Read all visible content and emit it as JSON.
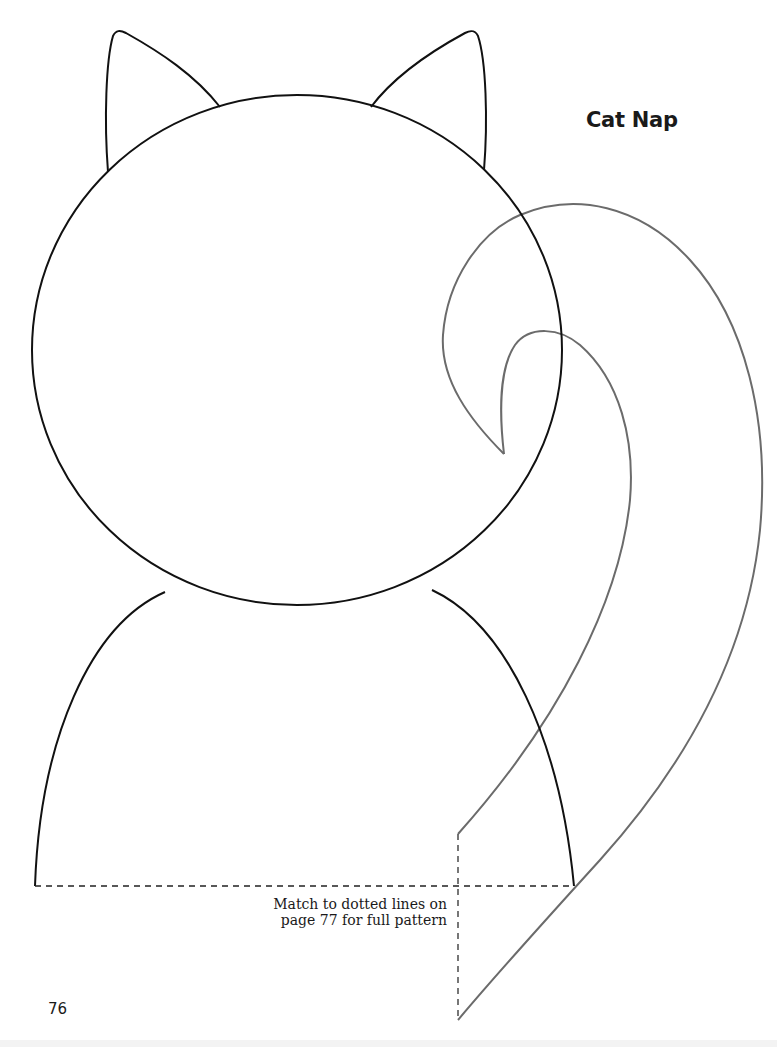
{
  "page": {
    "title": "Cat Nap",
    "page_number": "76",
    "note": "Match to dotted lines on page 77 for full pattern",
    "note_lines": [
      "Match to dotted lines on",
      "page 77 for full pattern"
    ]
  },
  "pattern": {
    "pieces": [
      "left-ear",
      "right-ear",
      "head",
      "body",
      "tail"
    ],
    "colors": {
      "outline": "#111111",
      "tail_outline": "#6b6b6b",
      "dashed_line": "#222222",
      "background": "#ffffff"
    }
  }
}
